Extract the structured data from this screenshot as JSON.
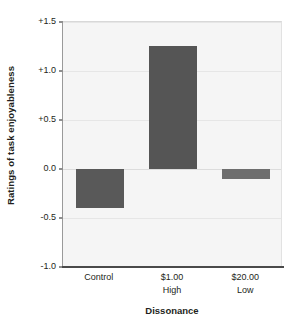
{
  "chart_data": {
    "type": "bar",
    "title": "",
    "xlabel": "Dissonance",
    "ylabel": "Ratings of task enjoyableness",
    "categories": [
      "Control",
      "$1.00",
      "$20.00"
    ],
    "category_sublabels": [
      "",
      "High",
      "Low"
    ],
    "values": [
      -0.4,
      1.26,
      -0.1
    ],
    "ylim": [
      -1.0,
      1.5
    ],
    "yticks": [
      "+1.5",
      "+1.0",
      "+0.5",
      "0.0",
      "-0.5",
      "-1.0"
    ],
    "ytick_values": [
      1.5,
      1.0,
      0.5,
      0.0,
      -0.5,
      -1.0
    ],
    "grid": true,
    "legend": "none",
    "bar_colors": [
      "#595959",
      "#555555",
      "#6e6e6e"
    ],
    "plot_background": "#f5f5f5"
  }
}
